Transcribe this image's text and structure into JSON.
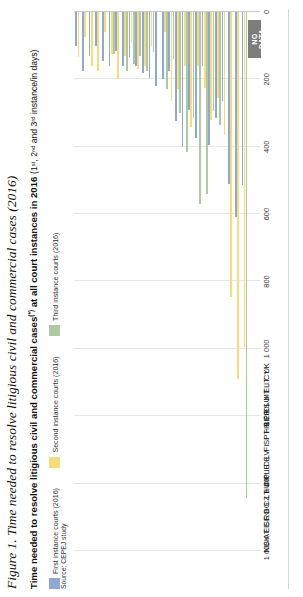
{
  "figure": {
    "caption": "Figure 1. Time needed to resolve litigious civil and commercial cases (2016)"
  },
  "title": {
    "bold_part": "Time needed to resolve litigious civil and commercial cases",
    "asterisk": "(*)",
    "bold_part2": " at all court instances in 2016 ",
    "paren": "(1ˢᵗ, 2ⁿᵈ and 3ʳᵈ instance/in days)"
  },
  "legend": {
    "items": [
      {
        "label": "First instance courts (2016)",
        "color": "#8fa8d8"
      },
      {
        "label": "Second instance courts (2016)",
        "color": "#f7dd7a"
      },
      {
        "label": "Third instance courts (2016)",
        "color": "#aec9a2"
      }
    ]
  },
  "source": {
    "label": "Source: CEPEJ study"
  },
  "nodata": {
    "line1": "NO",
    "line2": "DATA"
  },
  "chart_data": {
    "type": "bar",
    "orientation": "horizontal-rotated",
    "xlabel": "",
    "ylabel": "days",
    "ylim": [
      0,
      1600
    ],
    "yticks": [
      1600,
      1400,
      1200,
      1000,
      800,
      600,
      400,
      200,
      0
    ],
    "ytick_labels": [
      "1 600",
      "1 400",
      "1 200",
      "1 000",
      "800",
      "600",
      "400",
      "200",
      "0"
    ],
    "grid": true,
    "legend_position": "top-left",
    "categories": [
      "NL",
      "SK",
      "AT",
      "EE",
      "SE",
      "RO",
      "BG",
      "CZ",
      "LT",
      "HU",
      "DK",
      "PL",
      "IE",
      "DE",
      "LV",
      "FI",
      "SI",
      "PT",
      "HR",
      "BE",
      "FR",
      "ES",
      "LU",
      "MT",
      "EL",
      "IT",
      "CY",
      "UK"
    ],
    "series": [
      {
        "name": "First instance courts (2016)",
        "color": "#8fa8d8",
        "values": [
          100,
          175,
          130,
          100,
          145,
          160,
          115,
          160,
          135,
          160,
          180,
          195,
          220,
          200,
          175,
          325,
          400,
          290,
          375,
          160,
          395,
          315,
          265,
          510,
          610,
          514,
          null,
          null
        ]
      },
      {
        "name": "Second instance courts (2016)",
        "color": "#f7dd7a",
        "values": [
          135,
          75,
          160,
          175,
          60,
          125,
          200,
          130,
          90,
          170,
          160,
          100,
          null,
          60,
          265,
          230,
          160,
          340,
          160,
          225,
          320,
          255,
          365,
          845,
          1090,
          993,
          null,
          null
        ]
      },
      {
        "name": "Third instance courts (2016)",
        "color": "#aec9a2",
        "values": [
          null,
          null,
          null,
          null,
          null,
          125,
          null,
          175,
          155,
          130,
          175,
          120,
          null,
          230,
          140,
          300,
          415,
          315,
          570,
          540,
          295,
          335,
          null,
          null,
          null,
          1442,
          null,
          null
        ]
      }
    ],
    "no_data_countries": [
      "CY",
      "UK"
    ]
  }
}
